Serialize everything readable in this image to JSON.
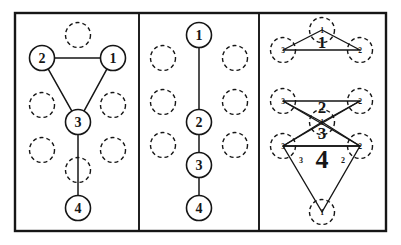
{
  "figure": {
    "title": "",
    "type": "diagram",
    "background": "#ffffff",
    "ink": "#161616",
    "outer_border": {
      "x": 15,
      "y": 13,
      "w": 371,
      "h": 218,
      "stroke": 2.4
    },
    "dividers": [
      139,
      259
    ],
    "node_style": {
      "solid_radius": 12.5,
      "dashed_radius": 12.5,
      "solid_stroke": 1.6,
      "dashed_stroke": 1.4,
      "dash_pattern": "4,3"
    },
    "panels": [
      {
        "id": "panel-1",
        "name": "triangle-plus-tail",
        "x": 15,
        "width": 124,
        "solid_nodes": [
          {
            "label": "2",
            "cx": 42,
            "cy": 58
          },
          {
            "label": "1",
            "cx": 113,
            "cy": 58
          },
          {
            "label": "3",
            "cx": 78,
            "cy": 122
          },
          {
            "label": "4",
            "cx": 78,
            "cy": 208
          }
        ],
        "dashed_nodes": [
          {
            "cx": 78,
            "cy": 35
          },
          {
            "cx": 42,
            "cy": 105
          },
          {
            "cx": 113,
            "cy": 105
          },
          {
            "cx": 42,
            "cy": 150
          },
          {
            "cx": 113,
            "cy": 150
          },
          {
            "cx": 78,
            "cy": 170
          }
        ],
        "edges": [
          {
            "from": "2",
            "to": "1"
          },
          {
            "from": "2",
            "to": "3"
          },
          {
            "from": "1",
            "to": "3"
          },
          {
            "from": "3",
            "to": "4"
          }
        ]
      },
      {
        "id": "panel-2",
        "name": "vertical-chain",
        "x": 139,
        "width": 120,
        "solid_nodes": [
          {
            "label": "1",
            "cx": 199,
            "cy": 35
          },
          {
            "label": "2",
            "cx": 199,
            "cy": 122
          },
          {
            "label": "3",
            "cx": 199,
            "cy": 165
          },
          {
            "label": "4",
            "cx": 199,
            "cy": 208
          }
        ],
        "dashed_nodes": [
          {
            "cx": 163,
            "cy": 58
          },
          {
            "cx": 235,
            "cy": 58
          },
          {
            "cx": 163,
            "cy": 102
          },
          {
            "cx": 235,
            "cy": 102
          },
          {
            "cx": 163,
            "cy": 145
          },
          {
            "cx": 235,
            "cy": 145
          }
        ],
        "edges": [
          {
            "from": "1",
            "to": "2"
          },
          {
            "from": "2",
            "to": "3"
          },
          {
            "from": "3",
            "to": "4"
          }
        ]
      },
      {
        "id": "panel-3",
        "name": "overlapping-triangles",
        "x": 259,
        "width": 127,
        "big_labels": [
          {
            "text": "1",
            "x": 322,
            "y": 48,
            "size": 17
          },
          {
            "text": "2",
            "x": 322,
            "y": 113,
            "size": 17
          },
          {
            "text": "3",
            "x": 322,
            "y": 139,
            "size": 17
          },
          {
            "text": "4",
            "x": 322,
            "y": 168,
            "size": 26
          }
        ],
        "dashed_nodes": [
          {
            "cx": 322,
            "cy": 30,
            "mark": "1"
          },
          {
            "cx": 283,
            "cy": 50,
            "mark": "3"
          },
          {
            "cx": 360,
            "cy": 50,
            "mark": "2"
          },
          {
            "cx": 283,
            "cy": 101,
            "mark": "3"
          },
          {
            "cx": 360,
            "cy": 101,
            "mark": "2"
          },
          {
            "cx": 322,
            "cy": 122,
            "mark": "1"
          },
          {
            "cx": 283,
            "cy": 146,
            "mark": "3"
          },
          {
            "cx": 360,
            "cy": 146,
            "mark": "2"
          },
          {
            "cx": 322,
            "cy": 212,
            "mark": "1"
          }
        ],
        "small_marks": [
          {
            "text": "3",
            "x": 301,
            "y": 163
          },
          {
            "text": "2",
            "x": 343,
            "y": 163
          }
        ],
        "triangles": [
          {
            "name": "tri-1",
            "points": "322,30 283,50 360,50"
          },
          {
            "name": "tri-2",
            "points": "283,101 360,101 322,122"
          },
          {
            "name": "tri-3",
            "points": "283,146 360,146 322,122"
          },
          {
            "name": "tri-4",
            "points": "283,146 360,146 322,212"
          }
        ],
        "cross_edges": [
          {
            "from": [
              283,
              101
            ],
            "to": [
              360,
              146
            ]
          },
          {
            "from": [
              360,
              101
            ],
            "to": [
              283,
              146
            ]
          }
        ]
      }
    ]
  }
}
